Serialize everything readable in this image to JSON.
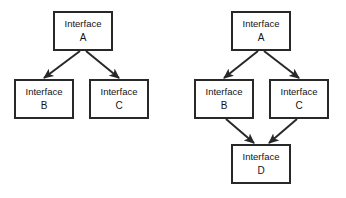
{
  "diagram": {
    "colors": {
      "background": "#ffffff",
      "box_fill": "#ffffff",
      "box_stroke": "#282828",
      "arrow": "#282828",
      "text": "#141414"
    },
    "panels": [
      {
        "id": "left-panel",
        "name": "single-inheritance-tree",
        "nodes": [
          {
            "id": "left-a",
            "name": "interface-a",
            "line1": "Interface",
            "line2": "A",
            "x": 54,
            "y": 12,
            "w": 58,
            "h": 38
          },
          {
            "id": "left-b",
            "name": "interface-b",
            "line1": "Interface",
            "line2": "B",
            "x": 15,
            "y": 80,
            "w": 58,
            "h": 38
          },
          {
            "id": "left-c",
            "name": "interface-c",
            "line1": "Interface",
            "line2": "C",
            "x": 90,
            "y": 80,
            "w": 58,
            "h": 38
          }
        ],
        "edges": [
          {
            "id": "left-a-b",
            "name": "arrow-a-to-b",
            "from": "left-a",
            "to": "left-b",
            "x1": 80,
            "y1": 51,
            "x2": 44,
            "y2": 78
          },
          {
            "id": "left-a-c",
            "name": "arrow-a-to-c",
            "from": "left-a",
            "to": "left-c",
            "x1": 86,
            "y1": 51,
            "x2": 119,
            "y2": 78
          }
        ]
      },
      {
        "id": "right-panel",
        "name": "diamond-inheritance-tree",
        "nodes": [
          {
            "id": "right-a",
            "name": "interface-a",
            "line1": "Interface",
            "line2": "A",
            "x": 232,
            "y": 12,
            "w": 58,
            "h": 38
          },
          {
            "id": "right-b",
            "name": "interface-b",
            "line1": "Interface",
            "line2": "B",
            "x": 195,
            "y": 80,
            "w": 58,
            "h": 38
          },
          {
            "id": "right-c",
            "name": "interface-c",
            "line1": "Interface",
            "line2": "C",
            "x": 270,
            "y": 80,
            "w": 58,
            "h": 38
          },
          {
            "id": "right-d",
            "name": "interface-d",
            "line1": "Interface",
            "line2": "D",
            "x": 232,
            "y": 145,
            "w": 58,
            "h": 38
          }
        ],
        "edges": [
          {
            "id": "right-a-b",
            "name": "arrow-a-to-b",
            "from": "right-a",
            "to": "right-b",
            "x1": 258,
            "y1": 51,
            "x2": 224,
            "y2": 78
          },
          {
            "id": "right-a-c",
            "name": "arrow-a-to-c",
            "from": "right-a",
            "to": "right-c",
            "x1": 264,
            "y1": 51,
            "x2": 299,
            "y2": 78
          },
          {
            "id": "right-b-d",
            "name": "arrow-b-to-d",
            "from": "right-b",
            "to": "right-d",
            "x1": 226,
            "y1": 119,
            "x2": 254,
            "y2": 143
          },
          {
            "id": "right-c-d",
            "name": "arrow-c-to-d",
            "from": "right-c",
            "to": "right-d",
            "x1": 297,
            "y1": 119,
            "x2": 269,
            "y2": 143
          }
        ]
      }
    ]
  }
}
